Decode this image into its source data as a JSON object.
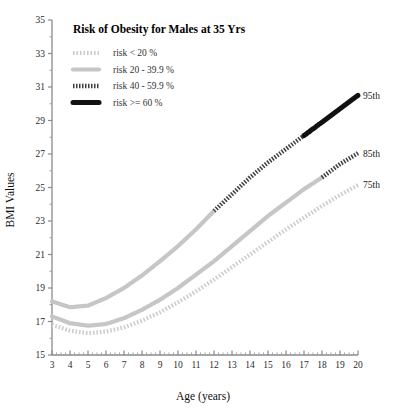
{
  "chart_data": {
    "type": "line",
    "title": "Risk of Obesity for Males at 35 Yrs",
    "xlabel": "Age (years)",
    "ylabel": "BMI Values",
    "xlim": [
      3,
      20
    ],
    "ylim": [
      15,
      35
    ],
    "grid": false,
    "legend_position": "upper-left-inside",
    "x_ticks": [
      3,
      4,
      5,
      6,
      7,
      8,
      9,
      10,
      11,
      12,
      13,
      14,
      15,
      16,
      17,
      18,
      19,
      20
    ],
    "y_ticks": [
      15,
      17,
      19,
      21,
      23,
      25,
      27,
      29,
      31,
      33,
      35
    ],
    "legend": [
      {
        "label": "risk < 20 %",
        "style": "light-hatch",
        "color": "#cfcfcf"
      },
      {
        "label": "risk 20 - 39.9 %",
        "style": "light-solid",
        "color": "#c4c4c4"
      },
      {
        "label": "risk 40 - 59.9 %",
        "style": "dark-hatch",
        "color": "#4a4a4a"
      },
      {
        "label": "risk >= 60 %",
        "style": "solid-thick",
        "color": "#111111"
      }
    ],
    "series": [
      {
        "name": "95th",
        "end_label": "95th",
        "x": [
          3,
          4,
          5,
          6,
          7,
          8,
          9,
          10,
          11,
          12,
          13,
          14,
          15,
          16,
          17,
          18,
          19,
          20
        ],
        "values": [
          18.2,
          17.85,
          17.95,
          18.4,
          19.0,
          19.75,
          20.6,
          21.5,
          22.5,
          23.6,
          24.6,
          25.6,
          26.5,
          27.3,
          28.1,
          28.9,
          29.7,
          30.5
        ],
        "risk_segments": [
          {
            "from": 3,
            "to": 12,
            "style": "light-solid"
          },
          {
            "from": 12,
            "to": 17,
            "style": "dark-hatch"
          },
          {
            "from": 17,
            "to": 20,
            "style": "solid-thick"
          }
        ]
      },
      {
        "name": "85th",
        "end_label": "85th",
        "x": [
          3,
          4,
          5,
          6,
          7,
          8,
          9,
          10,
          11,
          12,
          13,
          14,
          15,
          16,
          17,
          18,
          19,
          20
        ],
        "values": [
          17.3,
          16.9,
          16.75,
          16.85,
          17.2,
          17.7,
          18.3,
          19.0,
          19.8,
          20.6,
          21.5,
          22.4,
          23.3,
          24.1,
          24.9,
          25.6,
          26.4,
          27.05
        ],
        "risk_segments": [
          {
            "from": 3,
            "to": 18,
            "style": "light-solid"
          },
          {
            "from": 18,
            "to": 20,
            "style": "dark-hatch"
          }
        ]
      },
      {
        "name": "75th",
        "end_label": "75th",
        "x": [
          3,
          4,
          5,
          6,
          7,
          8,
          9,
          10,
          11,
          12,
          13,
          14,
          15,
          16,
          17,
          18,
          19,
          20
        ],
        "values": [
          16.8,
          16.45,
          16.3,
          16.4,
          16.65,
          17.05,
          17.55,
          18.15,
          18.8,
          19.5,
          20.25,
          21.0,
          21.75,
          22.5,
          23.2,
          23.9,
          24.55,
          25.15
        ],
        "risk_segments": [
          {
            "from": 3,
            "to": 20,
            "style": "light-hatch"
          }
        ]
      }
    ]
  }
}
